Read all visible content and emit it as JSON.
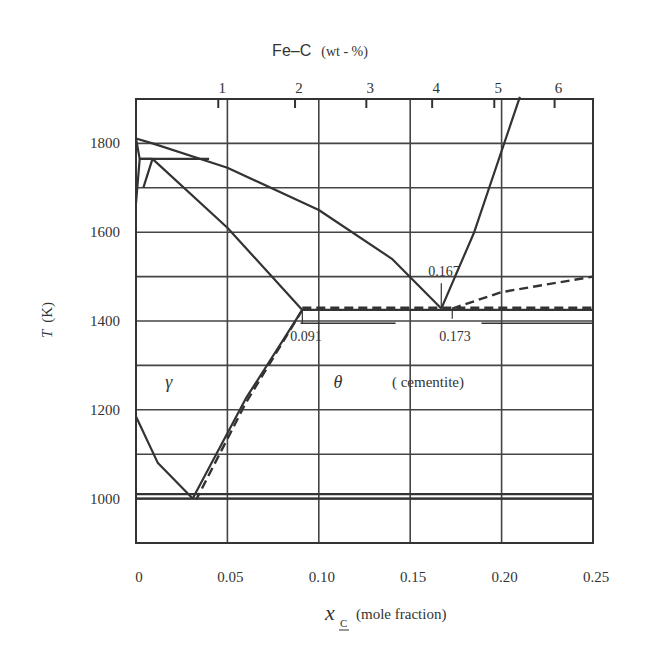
{
  "chart_data": {
    "type": "line",
    "title": "Fe–C (wt - %)",
    "title_main": "Fe–C",
    "title_unit": "(wt - %)",
    "xlabel": "x_C (mole fraction)",
    "xlabel_symbol": "x",
    "xlabel_sub": "C",
    "xlabel_rest": "(mole fraction)",
    "ylabel": "T (K)",
    "ylabel_symbol": "T",
    "ylabel_rest": "(K)",
    "xlim": [
      0,
      0.25
    ],
    "ylim": [
      900,
      1900
    ],
    "grid": true,
    "x_ticks": [
      "0",
      "0.05",
      "0.10",
      "0.15",
      "0.20",
      "0.25"
    ],
    "x_tick_values": [
      0,
      0.05,
      0.1,
      0.15,
      0.2,
      0.25
    ],
    "y_ticks": [
      "1000",
      "1200",
      "1400",
      "1600",
      "1800"
    ],
    "y_tick_values": [
      1000,
      1200,
      1400,
      1600,
      1800
    ],
    "top_axis": {
      "label": "Fe–C (wt - %)",
      "ticks": [
        "1",
        "2",
        "3",
        "4",
        "5",
        "6"
      ],
      "tick_mole_fraction": [
        0.045,
        0.087,
        0.126,
        0.162,
        0.196,
        0.229
      ]
    },
    "annotations": [
      {
        "text": "0.091",
        "x": 0.091,
        "y": 1425
      },
      {
        "text": "0.167",
        "x": 0.167,
        "y": 1428
      },
      {
        "text": "0.173",
        "x": 0.173,
        "y": 1425
      }
    ],
    "phase_labels": [
      {
        "text": "γ",
        "x": 0.016,
        "y": 1260
      },
      {
        "text": "θ",
        "x": 0.108,
        "y": 1260
      },
      {
        "text": "( cementite)",
        "x": 0.173,
        "y": 1260
      }
    ],
    "series": [
      {
        "name": "liquidus (Fe-rich)",
        "style": "solid",
        "x": [
          0,
          0.009,
          0.05,
          0.1,
          0.14,
          0.167
        ],
        "y": [
          1811,
          1800,
          1745,
          1650,
          1540,
          1428
        ]
      },
      {
        "name": "delta/liquid region",
        "style": "solid",
        "x": [
          0,
          0.002,
          0.009
        ],
        "y": [
          1811,
          1765,
          1765
        ]
      },
      {
        "name": "delta solvus",
        "style": "solid",
        "x": [
          0,
          0.002
        ],
        "y": [
          1665,
          1765
        ]
      },
      {
        "name": "gamma/delta boundary",
        "style": "solid",
        "x": [
          0.004,
          0.009
        ],
        "y": [
          1700,
          1765
        ]
      },
      {
        "name": "peritectic line",
        "style": "solid",
        "x": [
          0.002,
          0.04
        ],
        "y": [
          1765,
          1765
        ]
      },
      {
        "name": "gamma solidus",
        "style": "solid",
        "x": [
          0.009,
          0.05,
          0.091
        ],
        "y": [
          1765,
          1610,
          1425
        ]
      },
      {
        "name": "gamma solvus (Acm)",
        "style": "solid",
        "x": [
          0.091,
          0.06,
          0.031
        ],
        "y": [
          1425,
          1225,
          1000
        ]
      },
      {
        "name": "gamma solvus (Acm) metastable",
        "style": "dashed",
        "x": [
          0.091,
          0.06,
          0.033
        ],
        "y": [
          1425,
          1215,
          998
        ]
      },
      {
        "name": "eutectic line",
        "style": "solid",
        "x": [
          0.091,
          0.25
        ],
        "y": [
          1425,
          1425
        ]
      },
      {
        "name": "eutectic line metastable",
        "style": "dashed",
        "x": [
          0.091,
          0.25
        ],
        "y": [
          1430,
          1430
        ]
      },
      {
        "name": "cementite liquidus",
        "style": "solid",
        "x": [
          0.167,
          0.185,
          0.21
        ],
        "y": [
          1428,
          1600,
          1905
        ]
      },
      {
        "name": "metastable graphite liquidus",
        "style": "dashed",
        "x": [
          0.173,
          0.2,
          0.25
        ],
        "y": [
          1428,
          1465,
          1500
        ]
      },
      {
        "name": "alpha solvus",
        "style": "solid",
        "x": [
          0,
          0.012,
          0.031
        ],
        "y": [
          1185,
          1080,
          1000
        ]
      },
      {
        "name": "eutectoid line",
        "style": "solid",
        "x": [
          0,
          0.25
        ],
        "y": [
          1000,
          1000
        ]
      },
      {
        "name": "eutectoid line metastable",
        "style": "solid",
        "x": [
          0,
          0.25
        ],
        "y": [
          1010,
          1010
        ]
      }
    ]
  },
  "colors": {
    "ink": "#333333",
    "grid": "#444444",
    "background": "#ffffff"
  }
}
